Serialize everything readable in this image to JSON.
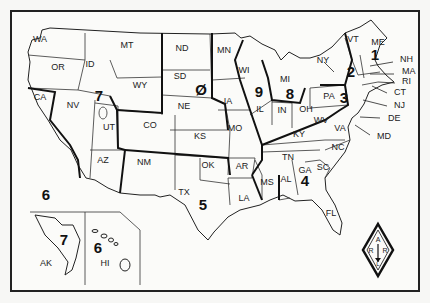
{
  "map": {
    "title": "US Amateur Radio Call Districts",
    "states": [
      {
        "code": "WA",
        "x": 40,
        "y": 42
      },
      {
        "code": "OR",
        "x": 58,
        "y": 70
      },
      {
        "code": "CA",
        "x": 40,
        "y": 100
      },
      {
        "code": "ID",
        "x": 90,
        "y": 67
      },
      {
        "code": "NV",
        "x": 73,
        "y": 108
      },
      {
        "code": "MT",
        "x": 127,
        "y": 48
      },
      {
        "code": "WY",
        "x": 140,
        "y": 88
      },
      {
        "code": "UT",
        "x": 109,
        "y": 130
      },
      {
        "code": "AZ",
        "x": 103,
        "y": 163
      },
      {
        "code": "CO",
        "x": 150,
        "y": 128
      },
      {
        "code": "NM",
        "x": 144,
        "y": 165
      },
      {
        "code": "ND",
        "x": 182,
        "y": 51
      },
      {
        "code": "SD",
        "x": 180,
        "y": 79
      },
      {
        "code": "NE",
        "x": 184,
        "y": 109
      },
      {
        "code": "KS",
        "x": 200,
        "y": 139
      },
      {
        "code": "OK",
        "x": 208,
        "y": 168
      },
      {
        "code": "TX",
        "x": 184,
        "y": 195
      },
      {
        "code": "MN",
        "x": 224,
        "y": 53
      },
      {
        "code": "IA",
        "x": 228,
        "y": 104
      },
      {
        "code": "MO",
        "x": 235,
        "y": 131
      },
      {
        "code": "AR",
        "x": 242,
        "y": 169
      },
      {
        "code": "LA",
        "x": 244,
        "y": 201
      },
      {
        "code": "WI",
        "x": 244,
        "y": 73
      },
      {
        "code": "IL",
        "x": 260,
        "y": 112
      },
      {
        "code": "MI",
        "x": 285,
        "y": 82
      },
      {
        "code": "IN",
        "x": 282,
        "y": 113
      },
      {
        "code": "OH",
        "x": 306,
        "y": 112
      },
      {
        "code": "KY",
        "x": 299,
        "y": 137
      },
      {
        "code": "TN",
        "x": 288,
        "y": 160
      },
      {
        "code": "MS",
        "x": 267,
        "y": 185
      },
      {
        "code": "AL",
        "x": 286,
        "y": 182
      },
      {
        "code": "GA",
        "x": 305,
        "y": 173
      },
      {
        "code": "SC",
        "x": 323,
        "y": 170
      },
      {
        "code": "FL",
        "x": 331,
        "y": 216
      },
      {
        "code": "NC",
        "x": 338,
        "y": 150
      },
      {
        "code": "VA",
        "x": 340,
        "y": 131
      },
      {
        "code": "WV",
        "x": 321,
        "y": 123
      },
      {
        "code": "PA",
        "x": 329,
        "y": 99
      },
      {
        "code": "NY",
        "x": 323,
        "y": 63
      },
      {
        "code": "VT",
        "x": 353,
        "y": 42
      },
      {
        "code": "ME",
        "x": 378,
        "y": 45
      },
      {
        "code": "AK",
        "x": 46,
        "y": 266
      },
      {
        "code": "HI",
        "x": 105,
        "y": 266
      }
    ],
    "callouts": [
      {
        "code": "NH",
        "x": 400,
        "y": 62
      },
      {
        "code": "MA",
        "x": 402,
        "y": 74
      },
      {
        "code": "RI",
        "x": 402,
        "y": 84
      },
      {
        "code": "CT",
        "x": 394,
        "y": 95
      },
      {
        "code": "NJ",
        "x": 394,
        "y": 108
      },
      {
        "code": "DE",
        "x": 388,
        "y": 121
      },
      {
        "code": "MD",
        "x": 377,
        "y": 139
      }
    ],
    "districts": [
      {
        "num": "1",
        "x": 375,
        "y": 60
      },
      {
        "num": "2",
        "x": 351,
        "y": 77
      },
      {
        "num": "3",
        "x": 344,
        "y": 103
      },
      {
        "num": "4",
        "x": 305,
        "y": 186
      },
      {
        "num": "5",
        "x": 203,
        "y": 210
      },
      {
        "num": "6",
        "x": 46,
        "y": 200
      },
      {
        "num": "7",
        "x": 99,
        "y": 101
      },
      {
        "num": "8",
        "x": 290,
        "y": 99
      },
      {
        "num": "9",
        "x": 259,
        "y": 97
      },
      {
        "num": "Ø",
        "x": 201,
        "y": 95
      },
      {
        "num": "7",
        "x": 64,
        "y": 245
      },
      {
        "num": "6",
        "x": 98,
        "y": 253
      }
    ],
    "logo": {
      "top": "A",
      "left": "R",
      "right": "R",
      "bottom": "L",
      "border_color": "#111"
    }
  }
}
